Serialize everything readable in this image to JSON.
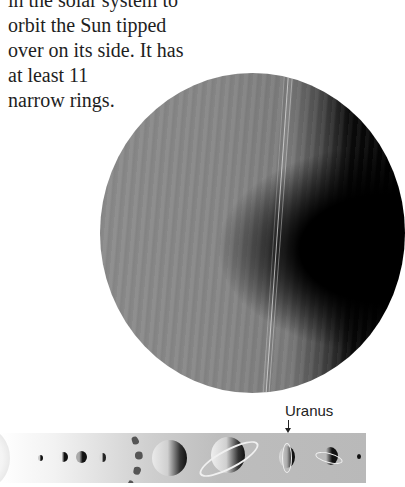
{
  "paragraph": {
    "lines": [
      "in the solar system to",
      "orbit the Sun tipped",
      "over on its side.  It has",
      "at least 11",
      "narrow rings."
    ]
  },
  "main_image": {
    "subject": "Uranus",
    "description": "Large grey banded planet with thin vertical rings, dark shadow on right side"
  },
  "solar_system_strip": {
    "label": "Uranus",
    "arrow": "down-arrow",
    "bodies": [
      "Sun",
      "Mercury",
      "Venus",
      "Earth",
      "Mars",
      "Asteroid belt",
      "Jupiter",
      "Saturn",
      "Uranus",
      "Neptune",
      "Pluto"
    ]
  },
  "colors": {
    "text": "#1e1e1e",
    "planet_grey": "#858585",
    "shadow": "#000000",
    "strip_bg": "#bdbdbd"
  }
}
